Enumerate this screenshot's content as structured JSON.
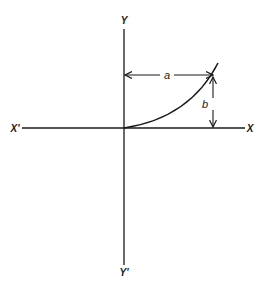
{
  "diagram": {
    "type": "coordinate-axes-with-curve",
    "axes": {
      "x_positive_label": "X",
      "x_negative_label": "X'",
      "y_positive_label": "Y",
      "y_negative_label": "Y'"
    },
    "dimensions": {
      "horizontal_label": "a",
      "vertical_label": "b"
    },
    "colors": {
      "stroke": "#1a1a1a",
      "background": "#ffffff"
    }
  }
}
